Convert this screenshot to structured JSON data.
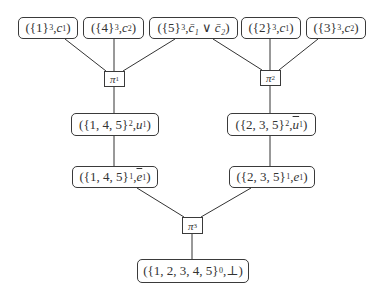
{
  "diagram": {
    "style": {
      "line_color": "#333333",
      "box_border": "#3a3a3a",
      "text_color": "#333333",
      "background": "#ffffff"
    },
    "nodes": [
      {
        "id": "n1",
        "set": "{1}",
        "exp": "3",
        "label": "c",
        "label_sub": "1",
        "bar": false,
        "x": 18,
        "y": 17,
        "w": 60,
        "h": 22
      },
      {
        "id": "n2",
        "set": "{4}",
        "exp": "3",
        "label": "c",
        "label_sub": "2",
        "bar": false,
        "x": 83,
        "y": 17,
        "w": 61,
        "h": 22
      },
      {
        "id": "n3",
        "set": "{5}",
        "exp": "3",
        "label": "c̄₁ ∨ c̄₂",
        "label_sub": "",
        "bar": false,
        "x": 149,
        "y": 17,
        "w": 89,
        "h": 22
      },
      {
        "id": "n4",
        "set": "{2}",
        "exp": "3",
        "label": "c",
        "label_sub": "1",
        "bar": false,
        "x": 241,
        "y": 17,
        "w": 60,
        "h": 22
      },
      {
        "id": "n5",
        "set": "{3}",
        "exp": "3",
        "label": "c",
        "label_sub": "2",
        "bar": false,
        "x": 306,
        "y": 17,
        "w": 60,
        "h": 22
      },
      {
        "id": "n6",
        "set": "{1, 4, 5}",
        "exp": "2",
        "label": "u",
        "label_sub": "1",
        "bar": false,
        "x": 71,
        "y": 113,
        "w": 88,
        "h": 23
      },
      {
        "id": "n7",
        "set": "{2, 3, 5}",
        "exp": "2",
        "label": "u",
        "label_sub": "1",
        "bar": true,
        "x": 227,
        "y": 113,
        "w": 89,
        "h": 23
      },
      {
        "id": "n8",
        "set": "{1, 4, 5}",
        "exp": "1",
        "label": "e",
        "label_sub": "1",
        "bar": true,
        "x": 72,
        "y": 166,
        "w": 86,
        "h": 22
      },
      {
        "id": "n9",
        "set": "{2, 3, 5}",
        "exp": "1",
        "label": "e",
        "label_sub": "1",
        "bar": false,
        "x": 229,
        "y": 166,
        "w": 86,
        "h": 22
      },
      {
        "id": "n10",
        "set": "{1, 2, 3, 4, 5}",
        "exp": "0",
        "label": "⊥",
        "label_sub": "",
        "bar": false,
        "x": 137,
        "y": 259,
        "w": 112,
        "h": 24
      }
    ],
    "ops": [
      {
        "id": "p1",
        "symbol": "π",
        "sub": "1",
        "x": 104,
        "y": 71,
        "w": 21,
        "h": 16
      },
      {
        "id": "p2",
        "symbol": "π",
        "sub": "2",
        "x": 260,
        "y": 70,
        "w": 21,
        "h": 16
      },
      {
        "id": "p3",
        "symbol": "π",
        "sub": "3",
        "x": 182,
        "y": 217,
        "w": 21,
        "h": 17
      }
    ],
    "edges": [
      {
        "from": "n1",
        "to": "p1",
        "x1": 65,
        "y1": 39,
        "x2": 106,
        "y2": 71
      },
      {
        "from": "n2",
        "to": "p1",
        "x1": 114,
        "y1": 39,
        "x2": 114,
        "y2": 71
      },
      {
        "from": "n3",
        "to": "p1",
        "x1": 175,
        "y1": 39,
        "x2": 123,
        "y2": 71
      },
      {
        "from": "n3",
        "to": "p2",
        "x1": 213,
        "y1": 39,
        "x2": 262,
        "y2": 70
      },
      {
        "from": "n4",
        "to": "p2",
        "x1": 270,
        "y1": 39,
        "x2": 270,
        "y2": 70
      },
      {
        "from": "n5",
        "to": "p2",
        "x1": 318,
        "y1": 39,
        "x2": 279,
        "y2": 70
      },
      {
        "from": "p1",
        "to": "n6",
        "x1": 114,
        "y1": 87,
        "x2": 114,
        "y2": 113
      },
      {
        "from": "p2",
        "to": "n7",
        "x1": 270,
        "y1": 86,
        "x2": 270,
        "y2": 113
      },
      {
        "from": "n6",
        "to": "n8",
        "x1": 114,
        "y1": 136,
        "x2": 114,
        "y2": 166
      },
      {
        "from": "n7",
        "to": "n9",
        "x1": 270,
        "y1": 136,
        "x2": 270,
        "y2": 166
      },
      {
        "from": "n8",
        "to": "p3",
        "x1": 137,
        "y1": 188,
        "x2": 184,
        "y2": 217
      },
      {
        "from": "n9",
        "to": "p3",
        "x1": 251,
        "y1": 188,
        "x2": 201,
        "y2": 217
      },
      {
        "from": "p3",
        "to": "n10",
        "x1": 192,
        "y1": 234,
        "x2": 192,
        "y2": 259
      }
    ]
  }
}
